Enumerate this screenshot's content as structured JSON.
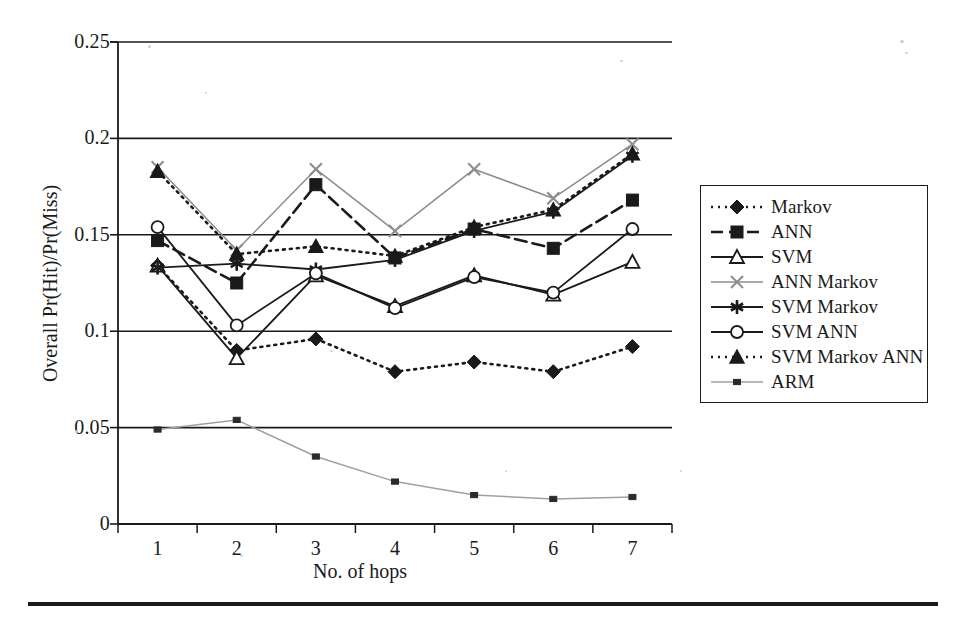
{
  "chart_data": {
    "type": "line",
    "title": "",
    "xlabel": "No. of hops",
    "ylabel": "Overall Pr(Hit)/Pr(Miss)",
    "x": [
      1,
      2,
      3,
      4,
      5,
      6,
      7
    ],
    "categories": [
      "1",
      "2",
      "3",
      "4",
      "5",
      "6",
      "7"
    ],
    "xtick_labels": [
      "1",
      "2",
      "3",
      "4",
      "5",
      "6",
      "7"
    ],
    "ytick_labels": [
      "0",
      "0.05",
      "0.1",
      "0.15",
      "0.2",
      "0.25"
    ],
    "ytick_values": [
      0,
      0.05,
      0.1,
      0.15,
      0.2,
      0.25
    ],
    "ylim": [
      0,
      0.25
    ],
    "xlim": [
      0.5,
      7.5
    ],
    "grid": "horizontal",
    "legend_position": "right",
    "series": [
      {
        "name": "Markov",
        "marker": "diamond-filled",
        "line": "dotted",
        "color": "#1a1a1a",
        "values": [
          0.134,
          0.09,
          0.096,
          0.079,
          0.084,
          0.079,
          0.092
        ]
      },
      {
        "name": "ANN",
        "marker": "square-filled",
        "line": "dashed",
        "color": "#1a1a1a",
        "values": [
          0.147,
          0.125,
          0.176,
          0.138,
          0.153,
          0.143,
          0.168
        ]
      },
      {
        "name": "SVM",
        "marker": "triangle-open",
        "line": "solid",
        "color": "#1a1a1a",
        "values": [
          0.134,
          0.086,
          0.129,
          0.113,
          0.129,
          0.119,
          0.136
        ]
      },
      {
        "name": "ANN Markov",
        "marker": "x-cross",
        "line": "solid-light",
        "color": "#8c8c8c",
        "values": [
          0.185,
          0.142,
          0.184,
          0.152,
          0.184,
          0.169,
          0.197
        ]
      },
      {
        "name": "SVM Markov",
        "marker": "asterisk",
        "line": "solid",
        "color": "#1a1a1a",
        "values": [
          0.133,
          0.135,
          0.132,
          0.137,
          0.152,
          0.162,
          0.191
        ]
      },
      {
        "name": "SVM ANN",
        "marker": "circle-open",
        "line": "solid",
        "color": "#1a1a1a",
        "values": [
          0.154,
          0.103,
          0.13,
          0.112,
          0.128,
          0.12,
          0.153
        ]
      },
      {
        "name": "SVM Markov ANN",
        "marker": "triangle-filled",
        "line": "dotted",
        "color": "#1a1a1a",
        "values": [
          0.183,
          0.14,
          0.144,
          0.139,
          0.154,
          0.163,
          0.192
        ]
      },
      {
        "name": "ARM",
        "marker": "square-small",
        "line": "solid-light",
        "color": "#a0a0a0",
        "values": [
          0.049,
          0.054,
          0.035,
          0.022,
          0.015,
          0.013,
          0.014
        ]
      }
    ]
  },
  "axes": {
    "y_title": "Overall Pr(Hit)/Pr(Miss)",
    "x_title": "No. of hops"
  },
  "legend": {
    "items": [
      {
        "label": "Markov"
      },
      {
        "label": "ANN"
      },
      {
        "label": "SVM"
      },
      {
        "label": "ANN Markov"
      },
      {
        "label": "SVM Markov"
      },
      {
        "label": "SVM ANN"
      },
      {
        "label": "SVM Markov ANN"
      },
      {
        "label": "ARM"
      }
    ]
  }
}
